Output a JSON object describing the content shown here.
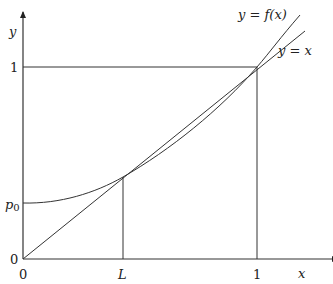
{
  "diagram": {
    "axes": {
      "x_label": "x",
      "y_label": "y",
      "x_ticks": [
        "0",
        "L",
        "1"
      ],
      "y_ticks": [
        "0",
        "p0",
        "1"
      ]
    },
    "curves": [
      {
        "name": "y = f(x)",
        "label": "y = f(x)",
        "type": "convex curve",
        "passes_through": [
          [
            0,
            "p0"
          ],
          [
            "L",
            "L"
          ],
          [
            1,
            1
          ]
        ]
      },
      {
        "name": "y = x",
        "label": "y = x",
        "type": "line"
      }
    ],
    "labels": {
      "f_curve": "y = f(x)",
      "identity": "y = x",
      "p0_main": "p",
      "p0_sub": "0",
      "zero_y": "0",
      "zero_x": "0",
      "L": "L",
      "one_x": "1",
      "one_y": "1",
      "x": "x",
      "y": "y"
    },
    "colors": {
      "line": "#333333",
      "background": "#ffffff"
    }
  }
}
